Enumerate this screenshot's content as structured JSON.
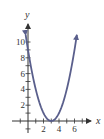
{
  "chart_data": {
    "type": "line",
    "title": "",
    "xlabel": "x",
    "ylabel": "y",
    "function": "y = (x - 3)^2",
    "xlim": [
      -1,
      7.5
    ],
    "ylim": [
      -1.5,
      12
    ],
    "x_ticks": [
      -1,
      1,
      2,
      3,
      4,
      5,
      6,
      7
    ],
    "x_tick_labels": [
      "2",
      "4",
      "6"
    ],
    "x_tick_label_values": [
      2,
      4,
      6
    ],
    "y_ticks": [
      -1,
      1,
      2,
      3,
      4,
      5,
      6,
      7,
      8,
      9,
      10
    ],
    "y_tick_labels": [
      "2",
      "4",
      "6",
      "8",
      "10"
    ],
    "y_tick_label_values": [
      2,
      4,
      6,
      8,
      10
    ],
    "grid": false,
    "legend": null,
    "series": [
      {
        "name": "parabola",
        "color": "#5a5f8c",
        "x": [
          -0.3,
          0,
          0.5,
          1,
          1.5,
          2,
          2.5,
          3,
          3.5,
          4,
          4.5,
          5,
          5.5,
          6,
          6.3
        ],
        "y": [
          10.89,
          9,
          6.25,
          4,
          2.25,
          1,
          0.25,
          0,
          0.25,
          1,
          2.25,
          4,
          6.25,
          9,
          10.89
        ]
      }
    ],
    "vertex": [
      3,
      0
    ],
    "arrows": "curve ends with arrowheads; axes have arrowheads on positive ends"
  },
  "colors": {
    "curve": "#5a5f8c",
    "axis": "#333333",
    "background": "#ffffff"
  }
}
